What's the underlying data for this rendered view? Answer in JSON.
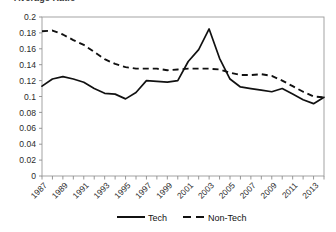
{
  "title_clipped": "Average Ratio",
  "legend": {
    "position": "bottom",
    "entries": [
      {
        "label": "Tech",
        "style": "solid"
      },
      {
        "label": "Non-Tech",
        "style": "dashed"
      }
    ]
  },
  "chart_data": {
    "type": "line",
    "title": "",
    "xlabel": "",
    "ylabel": "",
    "ylim": [
      0,
      0.2
    ],
    "ytick_step": 0.02,
    "ytick_labels": [
      "0",
      "0.02",
      "0.04",
      "0.06",
      "0.08",
      "0.1",
      "0.12",
      "0.14",
      "0.16",
      "0.18",
      "0.2"
    ],
    "grid": false,
    "x": [
      1987,
      1988,
      1989,
      1990,
      1991,
      1992,
      1993,
      1994,
      1995,
      1996,
      1997,
      1998,
      1999,
      2000,
      2001,
      2002,
      2003,
      2004,
      2005,
      2006,
      2007,
      2008,
      2009,
      2010,
      2011,
      2012,
      2013,
      2014
    ],
    "xtick_labels": [
      "1987",
      "1989",
      "1991",
      "1993",
      "1995",
      "1997",
      "1999",
      "2001",
      "2003",
      "2005",
      "2007",
      "2009",
      "2011",
      "2013"
    ],
    "xtick_label_every": 2,
    "series": [
      {
        "name": "Tech",
        "style": "solid",
        "values": [
          0.113,
          0.122,
          0.125,
          0.122,
          0.118,
          0.11,
          0.104,
          0.103,
          0.097,
          0.105,
          0.12,
          0.119,
          0.118,
          0.12,
          0.144,
          0.159,
          0.185,
          0.148,
          0.122,
          0.112,
          0.11,
          0.108,
          0.106,
          0.11,
          0.103,
          0.096,
          0.091,
          0.089
        ]
      },
      {
        "name": "Non-Tech",
        "style": "dashed",
        "values": [
          0.182,
          0.183,
          0.178,
          0.171,
          0.165,
          0.156,
          0.147,
          0.141,
          0.137,
          0.135,
          0.135,
          0.135,
          0.133,
          0.134,
          0.135,
          0.135,
          0.135,
          0.134,
          0.13,
          0.127,
          0.127,
          0.128,
          0.126,
          0.12,
          0.113,
          0.106,
          0.1,
          0.098
        ]
      }
    ],
    "series_tail": {
      "note": "both series converge near 0.099 at 2014",
      "tech_2013": 0.089,
      "tech_2014": 0.099,
      "nontech_2013": 0.096,
      "nontech_2014": 0.099
    }
  }
}
